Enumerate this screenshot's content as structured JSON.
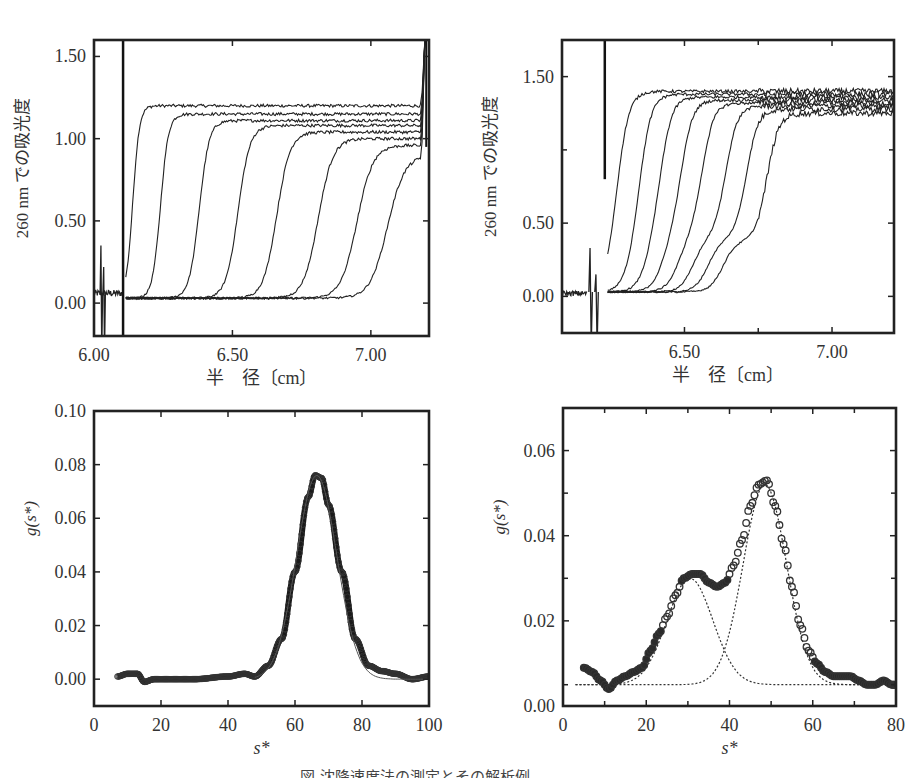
{
  "figure": {
    "caption": "図 沈降速度法の測定とその解析例",
    "caption_note": "caption clipped at bottom edge"
  },
  "chart_data": [
    {
      "id": "top-left",
      "type": "line",
      "title": "",
      "xlabel": "半　径〔cm〕",
      "ylabel": "260 nm での吸光度",
      "xlim": [
        6.0,
        7.21
      ],
      "ylim": [
        -0.2,
        1.6
      ],
      "xticks": [
        6.0,
        6.5,
        7.0
      ],
      "xtick_labels": [
        "6.00",
        "6.50",
        "7.00"
      ],
      "yticks": [
        0.0,
        0.5,
        1.0,
        1.5
      ],
      "ytick_labels": [
        "0.00",
        "0.50",
        "1.00",
        "1.50"
      ],
      "grid": false,
      "description": "Sedimentation velocity boundary scans, single boundary moving outward",
      "meniscus_x": 6.105,
      "baseline": 0.03,
      "series": [
        {
          "name": "scan 1",
          "midpoint": 6.11,
          "plateau": 1.2,
          "width": 0.01
        },
        {
          "name": "scan 2",
          "midpoint": 6.21,
          "plateau": 1.15,
          "width": 0.012
        },
        {
          "name": "scan 3",
          "midpoint": 6.35,
          "plateau": 1.11,
          "width": 0.015
        },
        {
          "name": "scan 4",
          "midpoint": 6.49,
          "plateau": 1.08,
          "width": 0.018
        },
        {
          "name": "scan 5",
          "midpoint": 6.63,
          "plateau": 1.04,
          "width": 0.02
        },
        {
          "name": "scan 6",
          "midpoint": 6.78,
          "plateau": 1.0,
          "width": 0.022
        },
        {
          "name": "scan 7",
          "midpoint": 6.92,
          "plateau": 0.96,
          "width": 0.024
        },
        {
          "name": "scan 8",
          "midpoint": 7.03,
          "plateau": 0.9,
          "width": 0.026
        }
      ]
    },
    {
      "id": "top-right",
      "type": "line",
      "title": "",
      "xlabel": "半　径〔cm〕",
      "ylabel": "260 nm での吸光度",
      "xlim": [
        6.085,
        7.21
      ],
      "ylim": [
        -0.25,
        1.75
      ],
      "xticks": [
        6.5,
        7.0
      ],
      "xtick_labels": [
        "6.50",
        "7.00"
      ],
      "minor_xticks": [
        6.75
      ],
      "yticks": [
        0.0,
        0.5,
        1.5
      ],
      "ytick_labels": [
        "0.00",
        "0.50",
        "1.50"
      ],
      "minor_yticks": [
        1.0
      ],
      "grid": false,
      "description": "Sedimentation velocity boundary scans, two-component boundary (shoulder at ~0.35)",
      "meniscus_x": 6.23,
      "baseline": 0.03,
      "series": [
        {
          "name": "scan 1",
          "mid1": 6.24,
          "mid2": 6.24,
          "plateau": 1.4,
          "step": 0.5
        },
        {
          "name": "scan 2",
          "mid1": 6.3,
          "mid2": 6.32,
          "plateau": 1.38,
          "step": 0.45
        },
        {
          "name": "scan 3",
          "mid1": 6.35,
          "mid2": 6.39,
          "plateau": 1.36,
          "step": 0.42
        },
        {
          "name": "scan 4",
          "mid1": 6.4,
          "mid2": 6.46,
          "plateau": 1.34,
          "step": 0.4
        },
        {
          "name": "scan 5",
          "mid1": 6.45,
          "mid2": 6.53,
          "plateau": 1.32,
          "step": 0.38
        },
        {
          "name": "scan 6",
          "mid1": 6.5,
          "mid2": 6.61,
          "plateau": 1.3,
          "step": 0.37
        },
        {
          "name": "scan 7",
          "mid1": 6.55,
          "mid2": 6.68,
          "plateau": 1.28,
          "step": 0.36
        },
        {
          "name": "scan 8",
          "mid1": 6.6,
          "mid2": 6.75,
          "plateau": 1.25,
          "step": 0.35
        }
      ]
    },
    {
      "id": "bottom-left",
      "type": "scatter",
      "title": "",
      "xlabel": "s*",
      "ylabel": "g(s*)",
      "xlim": [
        0,
        100
      ],
      "ylim": [
        -0.01,
        0.1
      ],
      "xticks": [
        0,
        20,
        40,
        60,
        80,
        100
      ],
      "xtick_labels": [
        "0",
        "20",
        "40",
        "60",
        "80",
        "100"
      ],
      "yticks": [
        0.0,
        0.02,
        0.04,
        0.06,
        0.08,
        0.1
      ],
      "ytick_labels": [
        "0.00",
        "0.02",
        "0.04",
        "0.06",
        "0.08",
        "0.10"
      ],
      "grid": false,
      "description": "Single-peak g(s*) distribution with Gaussian fit",
      "series": [
        {
          "name": "g(s*) data + fit",
          "peak_x": 66.5,
          "peak_y": 0.076,
          "sigma": 6.0,
          "x_range": [
            7,
            100
          ]
        }
      ],
      "points": [
        [
          7,
          0.001
        ],
        [
          10,
          0.002
        ],
        [
          13,
          0.002
        ],
        [
          15,
          -0.001
        ],
        [
          18,
          0.0
        ],
        [
          25,
          0.0
        ],
        [
          30,
          0.0
        ],
        [
          40,
          0.001
        ],
        [
          45,
          0.002
        ],
        [
          48,
          0.001
        ],
        [
          52,
          0.005
        ],
        [
          56,
          0.015
        ],
        [
          60,
          0.04
        ],
        [
          64,
          0.068
        ],
        [
          66,
          0.076
        ],
        [
          68,
          0.075
        ],
        [
          70,
          0.065
        ],
        [
          74,
          0.04
        ],
        [
          78,
          0.015
        ],
        [
          82,
          0.005
        ],
        [
          86,
          0.003
        ],
        [
          90,
          0.002
        ],
        [
          95,
          0.0
        ],
        [
          100,
          0.001
        ]
      ]
    },
    {
      "id": "bottom-right",
      "type": "scatter",
      "title": "",
      "xlabel": "s*",
      "ylabel": "g(s*)",
      "xlim": [
        0,
        80
      ],
      "ylim": [
        0.0,
        0.07
      ],
      "xticks": [
        0,
        20,
        40,
        60,
        80
      ],
      "xtick_labels": [
        "0",
        "20",
        "40",
        "60",
        "80"
      ],
      "minor_xticks": [
        10,
        30,
        50,
        70
      ],
      "yticks": [
        0.0,
        0.02,
        0.04,
        0.06
      ],
      "ytick_labels": [
        "0.00",
        "0.02",
        "0.04",
        "0.06"
      ],
      "minor_yticks": [
        0.005,
        0.03,
        0.05
      ],
      "grid": false,
      "description": "Two-peak g(s*) distribution (open circles) with two Gaussian components (dotted)",
      "baseline": 0.005,
      "components": [
        {
          "name": "component 1",
          "center": 30.5,
          "height": 0.03,
          "sigma": 5.5
        },
        {
          "name": "component 2",
          "center": 48.5,
          "height": 0.052,
          "sigma": 5.2
        }
      ],
      "points": [
        [
          5,
          0.009
        ],
        [
          7,
          0.008
        ],
        [
          9,
          0.006
        ],
        [
          11,
          0.004
        ],
        [
          13,
          0.006
        ],
        [
          15,
          0.007
        ],
        [
          17,
          0.008
        ],
        [
          19,
          0.009
        ],
        [
          21,
          0.013
        ],
        [
          23,
          0.017
        ],
        [
          25,
          0.021
        ],
        [
          27,
          0.026
        ],
        [
          29,
          0.03
        ],
        [
          31,
          0.031
        ],
        [
          33,
          0.031
        ],
        [
          35,
          0.029
        ],
        [
          37,
          0.028
        ],
        [
          39,
          0.029
        ],
        [
          41,
          0.033
        ],
        [
          43,
          0.039
        ],
        [
          45,
          0.047
        ],
        [
          47,
          0.052
        ],
        [
          49,
          0.053
        ],
        [
          51,
          0.047
        ],
        [
          53,
          0.038
        ],
        [
          55,
          0.028
        ],
        [
          57,
          0.019
        ],
        [
          59,
          0.013
        ],
        [
          61,
          0.01
        ],
        [
          63,
          0.008
        ],
        [
          65,
          0.007
        ],
        [
          67,
          0.007
        ],
        [
          69,
          0.007
        ],
        [
          71,
          0.006
        ],
        [
          73,
          0.005
        ],
        [
          75,
          0.005
        ],
        [
          77,
          0.006
        ],
        [
          79,
          0.005
        ],
        [
          80,
          0.005
        ]
      ]
    }
  ]
}
